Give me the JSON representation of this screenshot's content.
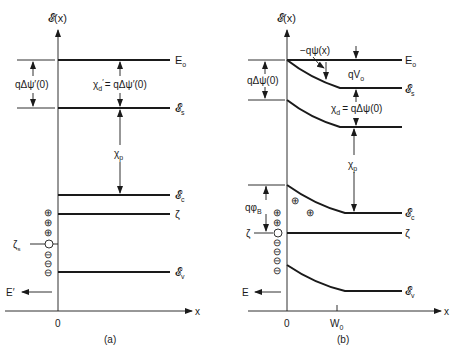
{
  "figure": {
    "panel_a": {
      "caption": "(a)",
      "y_axis_label": "𝓔(x)",
      "x_axis_label": "x",
      "origin_label": "0",
      "levels": [
        {
          "name": "vacuum-level",
          "label": "E",
          "sub": "o"
        },
        {
          "name": "surface-level",
          "label": "𝓔",
          "sub": "s"
        },
        {
          "name": "conduction-band",
          "label": "𝓔",
          "sub": "c"
        },
        {
          "name": "fermi-level",
          "label": "ζ",
          "sub": ""
        },
        {
          "name": "valence-band",
          "label": "𝓔",
          "sub": "v"
        }
      ],
      "dipole_label": "qΔψ′(0)",
      "affinity_label_lhs": "χ",
      "affinity_label_lhs_sub": "d",
      "affinity_label_lhs_prime": "′",
      "affinity_label_rhs": "= qΔψ′(0)",
      "chi_p_label": "χ",
      "chi_p_sub": "p",
      "surface_state_label": "ζ",
      "surface_state_sub": "s",
      "field_label": "E′",
      "charges": [
        "⊕",
        "⊕",
        "⊕",
        "○",
        "⊖",
        "⊖",
        "⊖"
      ]
    },
    "panel_b": {
      "caption": "(b)",
      "y_axis_label": "𝓔(x)",
      "x_axis_label": "x",
      "origin_label": "0",
      "depletion_label": "W",
      "depletion_sub": "0",
      "levels": [
        {
          "name": "vacuum-level",
          "label": "E",
          "sub": "o"
        },
        {
          "name": "surface-level",
          "label": "𝓔",
          "sub": "s"
        },
        {
          "name": "conduction-band",
          "label": "𝓔",
          "sub": "c"
        },
        {
          "name": "fermi-level",
          "label": "ζ",
          "sub": ""
        },
        {
          "name": "valence-band",
          "label": "𝓔",
          "sub": "v"
        }
      ],
      "potential_label": "−qψ(x)",
      "built_in_label": "qV",
      "built_in_sub": "o",
      "dipole_label": "qΔψ(0)",
      "affinity_label_lhs": "χ",
      "affinity_label_lhs_sub": "d",
      "affinity_label_rhs": "= qΔψ(0)",
      "chi_p_label": "χ",
      "chi_p_sub": "p",
      "barrier_label": "qφ",
      "barrier_sub": "B",
      "fermi_left_label": "ζ",
      "field_label": "E",
      "charges": [
        "⊕",
        "⊕",
        "○",
        "⊖",
        "⊖",
        "⊖",
        "⊖"
      ],
      "bulk_charges": [
        "⊕",
        "⊕"
      ]
    }
  }
}
